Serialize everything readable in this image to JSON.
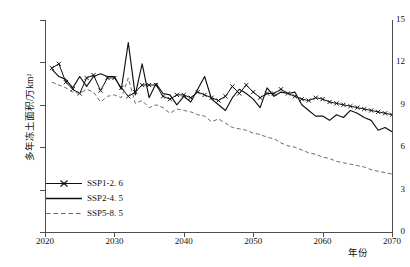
{
  "chart_data": {
    "type": "line",
    "title": "",
    "xlabel": "年份",
    "ylabel": "多年冻土面积/万km²",
    "xlim": [
      2020,
      2070
    ],
    "ylim": [
      0,
      15
    ],
    "xticks": [
      2020,
      2030,
      2040,
      2050,
      2060,
      2070
    ],
    "yticks": [
      0,
      3,
      6,
      9,
      12,
      15
    ],
    "grid": false,
    "legend_position": "lower-left",
    "x": [
      2021,
      2022,
      2023,
      2024,
      2025,
      2026,
      2027,
      2028,
      2029,
      2030,
      2031,
      2032,
      2033,
      2034,
      2035,
      2036,
      2037,
      2038,
      2039,
      2040,
      2041,
      2042,
      2043,
      2044,
      2045,
      2046,
      2047,
      2048,
      2049,
      2050,
      2051,
      2052,
      2053,
      2054,
      2055,
      2056,
      2057,
      2058,
      2059,
      2060,
      2061,
      2062,
      2063,
      2064,
      2065,
      2066,
      2067,
      2068,
      2069,
      2070
    ],
    "series": [
      {
        "name": "SSP1-2.6",
        "style": "solid-marker",
        "marker": "x",
        "color": "#111111",
        "values": [
          11.6,
          11.9,
          10.6,
          10.1,
          9.8,
          10.9,
          11.1,
          10.0,
          10.9,
          10.9,
          10.2,
          9.6,
          9.9,
          10.4,
          10.4,
          10.4,
          9.6,
          9.4,
          9.7,
          9.7,
          9.5,
          9.9,
          9.7,
          9.5,
          9.3,
          9.6,
          10.3,
          9.8,
          10.4,
          9.9,
          9.5,
          9.8,
          9.8,
          10.1,
          9.8,
          9.6,
          9.4,
          9.3,
          9.5,
          9.4,
          9.2,
          9.1,
          9.0,
          8.9,
          8.8,
          8.7,
          8.6,
          8.5,
          8.4,
          8.3
        ]
      },
      {
        "name": "SSP2-4.5",
        "style": "solid",
        "marker": "none",
        "color": "#111111",
        "values": [
          11.5,
          11.0,
          10.8,
          10.2,
          11.0,
          10.3,
          11.0,
          11.2,
          11.0,
          11.0,
          10.1,
          13.4,
          9.7,
          11.9,
          9.5,
          10.5,
          9.8,
          9.7,
          9.0,
          9.6,
          9.2,
          10.1,
          11.0,
          9.4,
          9.0,
          8.6,
          9.5,
          10.1,
          9.8,
          9.4,
          8.8,
          10.2,
          9.6,
          9.9,
          9.8,
          9.9,
          9.0,
          8.6,
          8.2,
          8.2,
          7.9,
          8.3,
          8.1,
          8.6,
          8.4,
          8.1,
          7.9,
          7.2,
          7.4,
          7.1
        ]
      },
      {
        "name": "SSP5-8.5",
        "style": "dashed",
        "marker": "none",
        "color": "#6b6b6b",
        "values": [
          10.6,
          10.4,
          10.2,
          9.9,
          9.8,
          10.1,
          9.9,
          9.2,
          9.6,
          9.7,
          9.5,
          10.9,
          9.1,
          9.3,
          8.8,
          9.0,
          8.8,
          8.4,
          8.7,
          8.6,
          8.5,
          8.3,
          8.2,
          7.8,
          8.0,
          7.7,
          7.4,
          7.3,
          7.2,
          7.0,
          6.9,
          6.7,
          6.6,
          6.3,
          6.1,
          6.0,
          5.8,
          5.6,
          5.5,
          5.3,
          5.2,
          5.0,
          4.9,
          4.8,
          4.7,
          4.6,
          4.4,
          4.3,
          4.2,
          4.1
        ]
      }
    ]
  },
  "legend": {
    "items": [
      {
        "label": "SSP1-2. 6"
      },
      {
        "label": "SSP2-4. 5"
      },
      {
        "label": "SSP5-8. 5"
      }
    ]
  }
}
